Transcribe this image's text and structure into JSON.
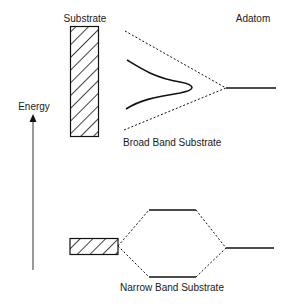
{
  "labels": {
    "substrate": "Substrate",
    "adatom": "Adatom",
    "energy": "Energy",
    "broad_band": "Broad Band Substrate",
    "narrow_band": "Narrow Band Substrate"
  },
  "colors": {
    "stroke": "#111111",
    "axis": "#555555",
    "background": "#ffffff"
  }
}
